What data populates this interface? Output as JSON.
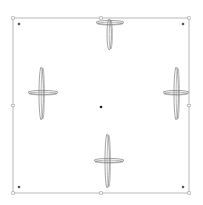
{
  "canvas": {
    "width": 203,
    "height": 205,
    "background": "#ffffff"
  },
  "frame": {
    "x": 13,
    "y": 18,
    "width": 176,
    "height": 175,
    "stroke": "#b8b8b8",
    "corner_dot_color": "#555555",
    "handle_color": "#9a9a9a"
  },
  "center_dot": {
    "x": 101,
    "y": 107,
    "color": "#222222"
  },
  "shapes": [
    {
      "name": "top",
      "cx": 110,
      "cy": 23,
      "v_up": 4,
      "v_down": 27,
      "h_left": 14,
      "h_right": 14
    },
    {
      "name": "left",
      "cx": 42,
      "cy": 93,
      "v_up": 26,
      "v_down": 27,
      "h_left": 14,
      "h_right": 16
    },
    {
      "name": "right",
      "cx": 177,
      "cy": 93,
      "v_up": 26,
      "v_down": 27,
      "h_left": 14,
      "h_right": 12
    },
    {
      "name": "bottom",
      "cx": 108,
      "cy": 161,
      "v_up": 27,
      "v_down": 27,
      "h_left": 14,
      "h_right": 16
    }
  ],
  "shape_stroke": "#8a8a8a"
}
